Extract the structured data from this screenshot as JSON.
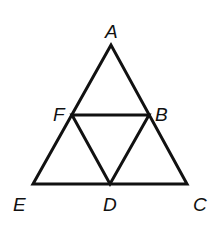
{
  "diagram": {
    "stroke_color": "#111111",
    "background": "#ffffff",
    "points": {
      "A": {
        "label": "A",
        "x": 111,
        "y": 45
      },
      "F": {
        "label": "F",
        "x": 72,
        "y": 115
      },
      "B": {
        "label": "B",
        "x": 149,
        "y": 115
      },
      "E": {
        "label": "E",
        "x": 33,
        "y": 184
      },
      "D": {
        "label": "D",
        "x": 110,
        "y": 184
      },
      "C": {
        "label": "C",
        "x": 187,
        "y": 184
      }
    },
    "segments": [
      "AE",
      "AC",
      "EC",
      "FB",
      "FD",
      "BD"
    ]
  }
}
